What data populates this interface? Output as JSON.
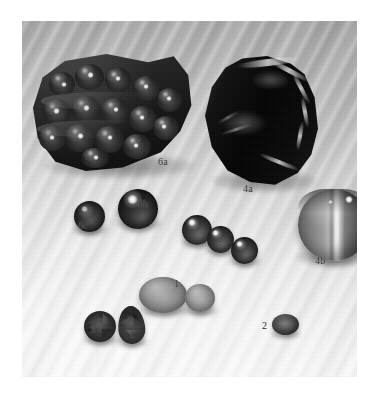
{
  "figure": {
    "type": "photographic-plate",
    "medium": "grayscale photograph",
    "page_background": "#ffffff",
    "plate": {
      "x": 22,
      "y": 21,
      "width": 335,
      "height": 356,
      "background_description": "pale gray rippled cloth backdrop, brighter toward lower area",
      "background_color_top": "#aeaeae",
      "background_color_bottom": "#fdfdfd"
    },
    "labels": [
      {
        "id": "label-6a",
        "text": "6a",
        "x": 158,
        "y": 157,
        "describes": "botryoidal dark mineral specimen, upper left"
      },
      {
        "id": "label-6b",
        "text": "6b",
        "x": 138,
        "y": 199,
        "describes": "large polished dark sphere"
      },
      {
        "id": "label-6c",
        "text": "6c",
        "x": 78,
        "y": 221,
        "describes": "small dark sphere"
      },
      {
        "id": "label-4a",
        "text": "4a",
        "x": 243,
        "y": 184,
        "describes": "dark banded rough chunk, upper right"
      },
      {
        "id": "label-4b",
        "text": "4b",
        "x": 315,
        "y": 256,
        "describes": "large banded agate sphere with bright stripe"
      },
      {
        "id": "label-5",
        "text": "5",
        "x": 218,
        "y": 240,
        "describes": "group of three medium dark spheres"
      },
      {
        "id": "label-1",
        "text": "1",
        "x": 174,
        "y": 279,
        "describes": "two oval cabochons"
      },
      {
        "id": "label-3",
        "text": "3",
        "x": 90,
        "y": 325,
        "describes": "two faceted gems: round and pear cut"
      },
      {
        "id": "label-2",
        "text": "2",
        "x": 262,
        "y": 321,
        "describes": "small faceted oval gem"
      }
    ],
    "specimens": [
      {
        "id": "spec-6a",
        "label": "6a",
        "kind": "rough-mineral",
        "shape": "botryoidal mass",
        "tone": "very dark with bright specular lumps"
      },
      {
        "id": "sph-6b",
        "label": "6b",
        "kind": "sphere",
        "shape": "polished sphere",
        "tone": "black glassy with highlight"
      },
      {
        "id": "sph-6c",
        "label": "6c",
        "kind": "sphere",
        "shape": "small sphere",
        "tone": "dark mottled"
      },
      {
        "id": "spec-4a",
        "label": "4a",
        "kind": "rough-mineral",
        "shape": "angular chunk",
        "tone": "black with pale banding at edge"
      },
      {
        "id": "sph-4b",
        "label": "4b",
        "kind": "sphere",
        "shape": "large sphere",
        "tone": "gray banded agate with white stripe"
      },
      {
        "id": "sph-5a",
        "label": "5",
        "kind": "sphere",
        "shape": "sphere",
        "tone": "dark gray"
      },
      {
        "id": "sph-5b",
        "label": "5",
        "kind": "sphere",
        "shape": "sphere",
        "tone": "dark gray"
      },
      {
        "id": "sph-5c",
        "label": "5",
        "kind": "sphere",
        "shape": "sphere",
        "tone": "dark gray"
      },
      {
        "id": "cab-1a",
        "label": "1",
        "kind": "cabochon",
        "shape": "oval cabochon",
        "tone": "mid gray"
      },
      {
        "id": "cab-1b",
        "label": "1",
        "kind": "cabochon",
        "shape": "round cabochon",
        "tone": "mid gray"
      },
      {
        "id": "gem-3a",
        "label": "3",
        "kind": "faceted-gem",
        "shape": "round brilliant",
        "tone": "dark"
      },
      {
        "id": "gem-3b",
        "label": "3",
        "kind": "faceted-gem",
        "shape": "pear cut",
        "tone": "dark"
      },
      {
        "id": "gem-2",
        "label": "2",
        "kind": "faceted-gem",
        "shape": "small oval",
        "tone": "dark gray"
      }
    ]
  }
}
